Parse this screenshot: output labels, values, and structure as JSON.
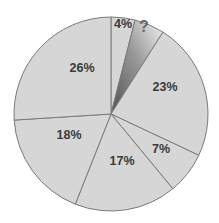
{
  "chart_data": {
    "type": "pie",
    "title": "",
    "start_angle_deg": 0,
    "direction": "clockwise",
    "slices": [
      {
        "label": "4%",
        "value": 4,
        "color": "#d6d6d6"
      },
      {
        "label": "?",
        "value": 5,
        "color": "gradient",
        "unknown": true
      },
      {
        "label": "23%",
        "value": 23,
        "color": "#d6d6d6"
      },
      {
        "label": "7%",
        "value": 7,
        "color": "#d6d6d6"
      },
      {
        "label": "17%",
        "value": 17,
        "color": "#d6d6d6"
      },
      {
        "label": "18%",
        "value": 18,
        "color": "#d6d6d6"
      },
      {
        "label": "26%",
        "value": 26,
        "color": "#d6d6d6"
      }
    ],
    "legend": "none"
  },
  "style": {
    "fill": "#d6d6d6",
    "stroke": "#7a7a7a",
    "label_color": "#3a3a3a"
  }
}
